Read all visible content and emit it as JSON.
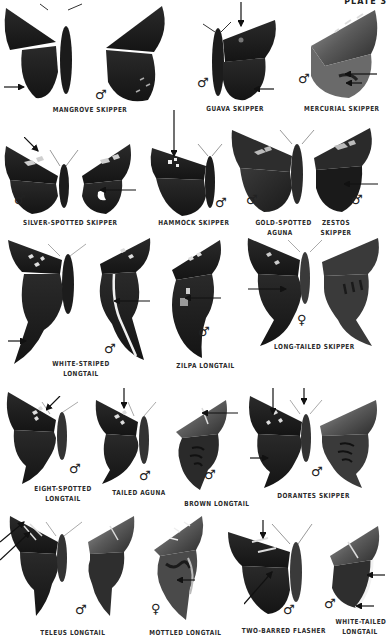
{
  "plate": {
    "title": "PLATE 3",
    "colors": {
      "background": "#ffffff",
      "wing_dark": "#1e1e1e",
      "wing_mid": "#4a4a4a",
      "wing_light": "#8a8a8a",
      "spot": "#d8d8d8",
      "label": "#2a2a2a"
    },
    "symbols": {
      "male": "♂",
      "female": "♀"
    }
  },
  "species": [
    {
      "id": "mangrove",
      "name": "MANGROVE SKIPPER",
      "sex": "♂"
    },
    {
      "id": "guava",
      "name": "GUAVA SKIPPER",
      "sex": "♂"
    },
    {
      "id": "mercurial",
      "name": "MERCURIAL SKIPPER",
      "sex": "♂"
    },
    {
      "id": "silver-spotted",
      "name": "SILVER-SPOTTED SKIPPER",
      "sex": "♂"
    },
    {
      "id": "hammock",
      "name": "HAMMOCK SKIPPER",
      "sex": "♂"
    },
    {
      "id": "gold-spotted-aguna",
      "name_line1": "GOLD-SPOTTED",
      "name_line2": "AGUNA",
      "sex": "♂"
    },
    {
      "id": "zestos",
      "name_line1": "ZESTOS",
      "name_line2": "SKIPPER",
      "sex": "♂"
    },
    {
      "id": "white-striped",
      "name_line1": "WHITE-STRIPED",
      "name_line2": "LONGTAIL",
      "sex": "♂"
    },
    {
      "id": "zilpa",
      "name": "ZILPA LONGTAIL",
      "sex": "♂"
    },
    {
      "id": "long-tailed",
      "name": "LONG-TAILED SKIPPER",
      "sex": "♀"
    },
    {
      "id": "eight-spotted",
      "name_line1": "EIGHT-SPOTTED",
      "name_line2": "LONGTAIL",
      "sex": "♂"
    },
    {
      "id": "tailed-aguna",
      "name": "TAILED AGUNA",
      "sex": "♂"
    },
    {
      "id": "brown-longtail",
      "name": "BROWN LONGTAIL",
      "sex": "♂"
    },
    {
      "id": "dorantes",
      "name": "DORANTES SKIPPER",
      "sex": "♂"
    },
    {
      "id": "teleus",
      "name": "TELEUS LONGTAIL",
      "sex": "♂"
    },
    {
      "id": "mottled",
      "name": "MOTTLED LONGTAIL",
      "sex": "♀"
    },
    {
      "id": "two-barred",
      "name": "TWO-BARRED FLASHER",
      "sex": "♂"
    },
    {
      "id": "white-tailed",
      "name_line1": "WHITE-TAILED",
      "name_line2": "LONGTAIL",
      "sex": "♂"
    }
  ]
}
